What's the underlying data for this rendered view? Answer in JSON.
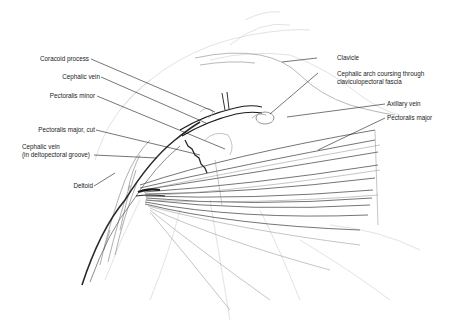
{
  "figure": {
    "labels_left": [
      {
        "id": "coracoid",
        "text": "Coracoid process"
      },
      {
        "id": "cephalic-vein",
        "text": "Cephalic vein"
      },
      {
        "id": "pectoralis-minor",
        "text": "Pectoralis minor"
      },
      {
        "id": "pectoralis-major-cut",
        "text": "Pectoralis major, cut"
      },
      {
        "id": "cephalic-vein-groove-1",
        "text": "Cephalic vein"
      },
      {
        "id": "cephalic-vein-groove-2",
        "text": "(in deltopectoral groove)"
      },
      {
        "id": "deltoid",
        "text": "Deltoid"
      }
    ],
    "labels_right": [
      {
        "id": "clavicle",
        "text": "Clavicle"
      },
      {
        "id": "cephalic-arch-1",
        "text": "Cephalic arch coursing through"
      },
      {
        "id": "cephalic-arch-2",
        "text": "claviculopectoral fascia"
      },
      {
        "id": "axillary-vein",
        "text": "Axillary vein"
      },
      {
        "id": "pectoralis-major",
        "text": "Pectoralis major"
      }
    ],
    "colors": {
      "ink": "#1a1a1a",
      "sketch": "#8a8a8a",
      "light_sketch": "#c4c4c4",
      "background": "#ffffff"
    }
  }
}
